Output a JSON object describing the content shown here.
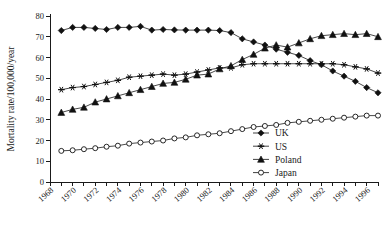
{
  "chart_data": {
    "type": "line",
    "title": "",
    "xlabel": "",
    "ylabel": "Mortality rate/100,000/year",
    "xlim": [
      1968,
      1997
    ],
    "ylim": [
      0,
      80
    ],
    "yticks": [
      0,
      10,
      20,
      30,
      40,
      50,
      60,
      70,
      80
    ],
    "ytick_labels": [
      "0",
      "10",
      "20",
      "30",
      "40",
      "50",
      "60",
      "70",
      "80"
    ],
    "xticks": [
      1968,
      1969,
      1970,
      1971,
      1972,
      1973,
      1974,
      1975,
      1976,
      1977,
      1978,
      1979,
      1980,
      1981,
      1982,
      1983,
      1984,
      1985,
      1986,
      1987,
      1988,
      1989,
      1990,
      1991,
      1992,
      1993,
      1994,
      1995,
      1996,
      1997
    ],
    "xtick_labels_shown": [
      "1968",
      "1970",
      "1972",
      "1974",
      "1976",
      "1978",
      "1980",
      "1982",
      "1984",
      "1986",
      "1988",
      "1990",
      "1992",
      "1994",
      "1996"
    ],
    "grid": false,
    "legend_position": "bottom-right",
    "x": [
      1969,
      1970,
      1971,
      1972,
      1973,
      1974,
      1975,
      1976,
      1977,
      1978,
      1979,
      1980,
      1981,
      1982,
      1983,
      1984,
      1985,
      1986,
      1987,
      1988,
      1989,
      1990,
      1991,
      1992,
      1993,
      1994,
      1995,
      1996,
      1997
    ],
    "series": [
      {
        "name": "UK",
        "marker": "filled-diamond",
        "color": "#111111",
        "values": [
          73.0,
          74.5,
          74.5,
          74.0,
          73.5,
          74.5,
          74.5,
          75.0,
          73.2,
          73.5,
          73.3,
          73.2,
          73.2,
          73.2,
          73.0,
          72.0,
          69.0,
          67.5,
          66.0,
          64.0,
          62.5,
          61.0,
          58.5,
          56.5,
          53.5,
          51.0,
          48.5,
          45.5,
          43.0
        ]
      },
      {
        "name": "US",
        "marker": "asterisk",
        "color": "#111111",
        "values": [
          44.5,
          45.5,
          46.0,
          47.0,
          48.0,
          49.0,
          50.5,
          51.0,
          51.5,
          52.0,
          51.5,
          52.0,
          53.0,
          54.0,
          55.0,
          55.0,
          56.5,
          57.0,
          57.0,
          57.0,
          57.0,
          57.0,
          57.0,
          57.0,
          57.0,
          56.5,
          55.5,
          54.5,
          52.5
        ]
      },
      {
        "name": "Poland",
        "marker": "filled-triangle",
        "color": "#111111",
        "values": [
          33.5,
          35.0,
          36.0,
          38.5,
          40.0,
          41.5,
          43.0,
          44.5,
          46.0,
          47.5,
          48.0,
          49.5,
          51.5,
          52.0,
          54.5,
          56.0,
          59.0,
          61.5,
          64.5,
          66.0,
          65.0,
          67.0,
          69.0,
          70.5,
          71.0,
          71.5,
          71.0,
          71.5,
          70.0
        ]
      },
      {
        "name": "Japan",
        "marker": "open-circle",
        "color": "#111111",
        "values": [
          15.0,
          15.3,
          15.8,
          16.3,
          17.0,
          17.5,
          18.5,
          19.0,
          19.5,
          20.0,
          21.0,
          21.5,
          22.5,
          23.0,
          23.5,
          24.5,
          25.5,
          26.5,
          27.0,
          27.5,
          28.5,
          29.0,
          29.5,
          30.0,
          30.5,
          31.0,
          31.5,
          32.0,
          32.0
        ]
      }
    ]
  },
  "legend": {
    "entries": [
      {
        "label": "UK",
        "marker": "filled-diamond"
      },
      {
        "label": "US",
        "marker": "asterisk"
      },
      {
        "label": "Poland",
        "marker": "filled-triangle"
      },
      {
        "label": "Japan",
        "marker": "open-circle"
      }
    ]
  }
}
